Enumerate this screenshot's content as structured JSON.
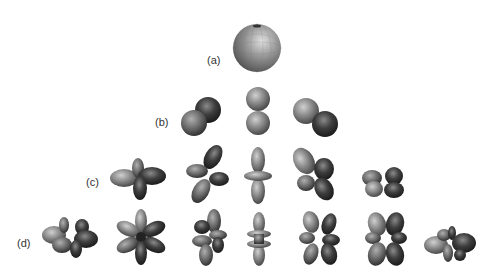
{
  "figure": {
    "rows": [
      {
        "label": "(a)",
        "count": 1
      },
      {
        "label": "(b)",
        "count": 3
      },
      {
        "label": "(c)",
        "count": 5
      },
      {
        "label": "(d)",
        "count": 7
      }
    ]
  },
  "colors": {
    "light": "#8a8a8a",
    "mid": "#6a6a6a",
    "dark": "#3a3a3a",
    "highlight": "#c8c8c8"
  }
}
